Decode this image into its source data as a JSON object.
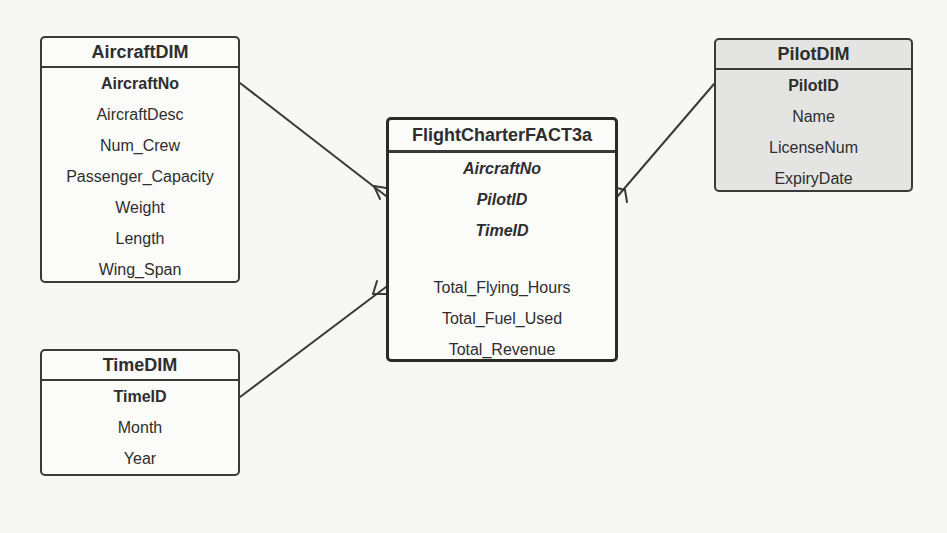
{
  "diagram": {
    "type": "star-schema-erd",
    "colors": {
      "background": "#f7f7f6",
      "border": "#3a3a3a",
      "text": "#2e2e2e",
      "shaded_fill": "#e4e4e3"
    },
    "entities": {
      "aircraft": {
        "title": "AircraftDIM",
        "attributes": [
          "AircraftNo",
          "AircraftDesc",
          "Num_Crew",
          "Passenger_Capacity",
          "Weight",
          "Length",
          "Wing_Span"
        ],
        "primary_key": "AircraftNo"
      },
      "pilot": {
        "title": "PilotDIM",
        "attributes": [
          "PilotID",
          "Name",
          "LicenseNum",
          "ExpiryDate"
        ],
        "primary_key": "PilotID"
      },
      "time": {
        "title": "TimeDIM",
        "attributes": [
          "TimeID",
          "Month",
          "Year"
        ],
        "primary_key": "TimeID"
      },
      "fact": {
        "title": "FlightCharterFACT3a",
        "foreign_keys": [
          "AircraftNo",
          "PilotID",
          "TimeID"
        ],
        "measures": [
          "Total_Flying_Hours",
          "Total_Fuel_Used",
          "Total_Revenue"
        ]
      }
    },
    "relationships": [
      {
        "from": "AircraftDIM",
        "to": "FlightCharterFACT3a",
        "cardinality": "one-to-many"
      },
      {
        "from": "PilotDIM",
        "to": "FlightCharterFACT3a",
        "cardinality": "one-to-many"
      },
      {
        "from": "TimeDIM",
        "to": "FlightCharterFACT3a",
        "cardinality": "one-to-many"
      }
    ]
  }
}
